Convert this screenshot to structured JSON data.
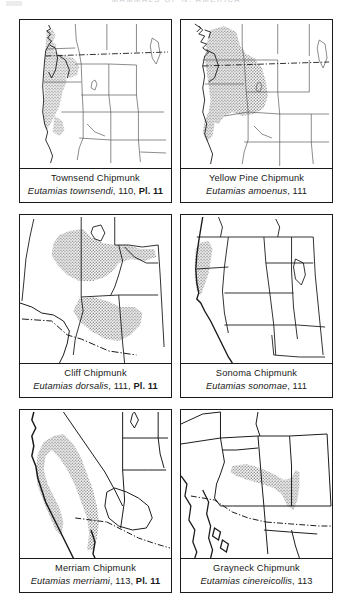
{
  "page": {
    "running_head": "MAMMALS OF N. AMERICA",
    "background_color": "#ffffff",
    "ink_color": "#1a1a1a",
    "range_shading_color": "#b9b9b9"
  },
  "figures": [
    {
      "id": "townsend-chipmunk",
      "common_name": "Townsend Chipmunk",
      "scientific_name": "Eutamias townsendi",
      "page_ref": "110",
      "plate_ref": "Pl. 11",
      "separator": ", ",
      "map": {
        "region": "western-north-america",
        "range_description": "Pacific coastal belt from southern British Columbia through Washington, Oregon and into northwestern California"
      }
    },
    {
      "id": "yellow-pine-chipmunk",
      "common_name": "Yellow Pine Chipmunk",
      "scientific_name": "Eutamias amoenus",
      "page_ref": "111",
      "plate_ref": "",
      "separator": ", ",
      "map": {
        "region": "western-north-america",
        "range_description": "Interior British Columbia, Washington, Idaho, western Montana, Oregon and northeastern California"
      }
    },
    {
      "id": "cliff-chipmunk",
      "common_name": "Cliff Chipmunk",
      "scientific_name": "Eutamias dorsalis",
      "page_ref": "111",
      "plate_ref": "Pl. 11",
      "separator": ", ",
      "map": {
        "region": "southwestern-united-states",
        "range_description": "Great Basin of Nevada and Utah south through Arizona and western New Mexico"
      }
    },
    {
      "id": "sonoma-chipmunk",
      "common_name": "Sonoma Chipmunk",
      "scientific_name": "Eutamias sonomae",
      "page_ref": "111",
      "plate_ref": "",
      "separator": ", ",
      "map": {
        "region": "western-united-states",
        "range_description": "Coastal northern California"
      }
    },
    {
      "id": "merriam-chipmunk",
      "common_name": "Merriam Chipmunk",
      "scientific_name": "Eutamias merriami",
      "page_ref": "113",
      "plate_ref": "Pl. 11",
      "separator": ", ",
      "map": {
        "region": "california",
        "range_description": "Coast ranges and southern Sierra Nevada of California into northern Baja California"
      }
    },
    {
      "id": "grayneck-chipmunk",
      "common_name": "Grayneck Chipmunk",
      "scientific_name": "Eutamias cinereicollis",
      "page_ref": "113",
      "plate_ref": "",
      "separator": ", ",
      "map": {
        "region": "arizona-new-mexico",
        "range_description": "Mountains of central Arizona and west-central New Mexico"
      }
    }
  ]
}
